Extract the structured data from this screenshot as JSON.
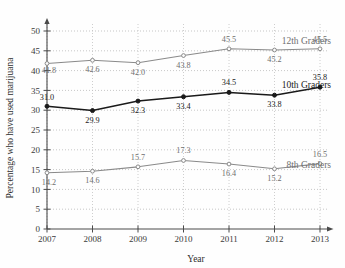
{
  "chart_data": {
    "type": "line",
    "title": "",
    "xlabel": "Year",
    "ylabel": "Percentage who have used marijuana",
    "x": [
      2007,
      2008,
      2009,
      2010,
      2011,
      2012,
      2013
    ],
    "xtick_labels": [
      "2007",
      "2008",
      "2009",
      "2010",
      "2011",
      "2012",
      "2013"
    ],
    "ytick_labels": [
      "0",
      "5",
      "10",
      "15",
      "20",
      "25",
      "30",
      "35",
      "40",
      "45",
      "50"
    ],
    "yticks": [
      0,
      5,
      10,
      15,
      20,
      25,
      30,
      35,
      40,
      45,
      50
    ],
    "ylim": [
      0,
      50
    ],
    "xlim": [
      2007,
      2013
    ],
    "grid": true,
    "legend_position": "inline-right",
    "series": [
      {
        "name": "12th Graders",
        "color": "#8a8a8a",
        "marker": "circle-open",
        "values": [
          41.8,
          42.6,
          42.0,
          43.8,
          45.5,
          45.2,
          45.5
        ],
        "labels": [
          "41.8",
          "42.6",
          "42.0",
          "43.8",
          "45.5",
          "45.2",
          "45.5"
        ]
      },
      {
        "name": "10th Graders",
        "color": "#1a1a1a",
        "marker": "circle-filled",
        "values": [
          31.0,
          29.9,
          32.3,
          33.4,
          34.5,
          33.8,
          35.8
        ],
        "labels": [
          "31.0",
          "29.9",
          "32.3",
          "33.4",
          "34.5",
          "33.8",
          "35.8"
        ]
      },
      {
        "name": "8th Graders",
        "color": "#8a8a8a",
        "marker": "circle-open",
        "values": [
          14.2,
          14.6,
          15.7,
          17.3,
          16.4,
          15.2,
          16.5
        ],
        "labels": [
          "14.2",
          "14.6",
          "15.7",
          "17.3",
          "16.4",
          "15.2",
          "16.5"
        ]
      }
    ]
  },
  "axes": {
    "x_title": "Year",
    "y_title": "Percentage who have used marijuana"
  },
  "series_names": {
    "s0": "12th Graders",
    "s1": "10th Graders",
    "s2": "8th Graders"
  },
  "colors": {
    "line_gray": "#8a8a8a",
    "line_dark": "#1a1a1a",
    "label_gray": "#6f6f6f",
    "label_dark": "#1a1a1a",
    "axis": "#4a4a4a",
    "grid": "#b9b9b9",
    "background": "#fefefe"
  }
}
